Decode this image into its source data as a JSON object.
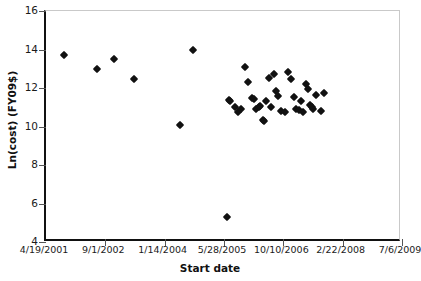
{
  "chart_data": {
    "type": "scatter",
    "title": "",
    "xlabel": "Start date",
    "ylabel": "Ln(cost) (FY09$)",
    "xtick_labels": [
      "4/19/2001",
      "9/1/2002",
      "1/14/2004",
      "5/28/2005",
      "10/10/2006",
      "2/22/2008",
      "7/6/2009"
    ],
    "ytick_labels": [
      "4",
      "6",
      "8",
      "10",
      "12",
      "14",
      "16"
    ],
    "ylim": [
      4,
      16
    ],
    "xlim": [
      "4/19/2001",
      "7/6/2009"
    ],
    "grid": false,
    "legend": null,
    "marker": "filled-diamond",
    "marker_color": "#111111",
    "points": [
      {
        "date": "2001-09-20",
        "value": 13.7
      },
      {
        "date": "2002-06-20",
        "value": 13.0
      },
      {
        "date": "2002-11-10",
        "value": 13.5
      },
      {
        "date": "2003-05-01",
        "value": 12.45
      },
      {
        "date": "2004-05-20",
        "value": 10.1
      },
      {
        "date": "2004-09-10",
        "value": 14.0
      },
      {
        "date": "2005-06-20",
        "value": 5.3
      },
      {
        "date": "2005-07-10",
        "value": 11.4
      },
      {
        "date": "2005-07-20",
        "value": 11.3
      },
      {
        "date": "2005-08-25",
        "value": 11.0
      },
      {
        "date": "2005-09-25",
        "value": 10.75
      },
      {
        "date": "2005-10-20",
        "value": 10.9
      },
      {
        "date": "2005-11-20",
        "value": 13.1
      },
      {
        "date": "2005-12-20",
        "value": 12.3
      },
      {
        "date": "2006-01-20",
        "value": 11.5
      },
      {
        "date": "2006-02-05",
        "value": 11.45
      },
      {
        "date": "2006-02-25",
        "value": 10.9
      },
      {
        "date": "2006-03-20",
        "value": 11.0
      },
      {
        "date": "2006-03-28",
        "value": 11.05
      },
      {
        "date": "2006-04-20",
        "value": 10.35
      },
      {
        "date": "2006-04-28",
        "value": 10.3
      },
      {
        "date": "2006-05-20",
        "value": 11.35
      },
      {
        "date": "2006-06-10",
        "value": 12.5
      },
      {
        "date": "2006-06-25",
        "value": 11.0
      },
      {
        "date": "2006-07-20",
        "value": 12.75
      },
      {
        "date": "2006-08-05",
        "value": 11.85
      },
      {
        "date": "2006-08-25",
        "value": 11.6
      },
      {
        "date": "2006-09-20",
        "value": 10.8
      },
      {
        "date": "2006-10-20",
        "value": 10.75
      },
      {
        "date": "2006-11-20",
        "value": 12.85
      },
      {
        "date": "2006-12-10",
        "value": 12.45
      },
      {
        "date": "2007-01-10",
        "value": 11.55
      },
      {
        "date": "2007-01-25",
        "value": 10.9
      },
      {
        "date": "2007-02-20",
        "value": 10.85
      },
      {
        "date": "2007-03-10",
        "value": 11.35
      },
      {
        "date": "2007-03-25",
        "value": 10.75
      },
      {
        "date": "2007-04-20",
        "value": 12.2
      },
      {
        "date": "2007-05-05",
        "value": 11.95
      },
      {
        "date": "2007-05-20",
        "value": 11.1
      },
      {
        "date": "2007-06-05",
        "value": 11.0
      },
      {
        "date": "2007-06-20",
        "value": 10.9
      },
      {
        "date": "2007-07-10",
        "value": 11.65
      },
      {
        "date": "2007-08-20",
        "value": 10.8
      },
      {
        "date": "2007-09-20",
        "value": 11.75
      }
    ]
  },
  "axes": {
    "x_title": "Start date",
    "y_title": "Ln(cost) (FY09$)"
  }
}
